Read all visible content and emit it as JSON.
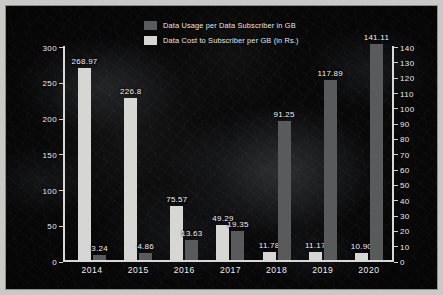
{
  "chart_data": {
    "type": "bar",
    "title": "",
    "xlabel": "",
    "categories": [
      "2014",
      "2015",
      "2016",
      "2017",
      "2018",
      "2019",
      "2020"
    ],
    "series": [
      {
        "name": "Data Cost to Subscriber per GB (in Rs.)",
        "axis": "left",
        "color": "#d6d6d4",
        "values": [
          268.97,
          226.8,
          75.57,
          49.29,
          11.78,
          11.17,
          10.9
        ],
        "labels": [
          "268.97",
          "226.8",
          "75.57",
          "49.29",
          "11.78",
          "11.17",
          "10.90"
        ]
      },
      {
        "name": "Data Usage per Data Subscriber in GB",
        "axis": "right",
        "color": "#585a5c",
        "values": [
          3.24,
          4.86,
          13.63,
          19.35,
          91.25,
          117.89,
          141.11
        ],
        "labels": [
          "3.24",
          "4.86",
          "13.63",
          "19.35",
          "91.25",
          "117.89",
          "141.11"
        ]
      }
    ],
    "left_axis": {
      "label": "",
      "ylim": [
        0,
        300
      ],
      "ticks": [
        "0",
        "50",
        "100",
        "150",
        "200",
        "250",
        "300"
      ],
      "tick_values": [
        0,
        50,
        100,
        150,
        200,
        250,
        300
      ]
    },
    "right_axis": {
      "label": "",
      "ylim": [
        0,
        140
      ],
      "ticks": [
        "0",
        "10",
        "20",
        "30",
        "40",
        "50",
        "60",
        "70",
        "80",
        "90",
        "100",
        "110",
        "120",
        "130",
        "140"
      ],
      "tick_values": [
        0,
        10,
        20,
        30,
        40,
        50,
        60,
        70,
        80,
        90,
        100,
        110,
        120,
        130,
        140
      ]
    },
    "legend": {
      "position": "top-center",
      "entries": [
        {
          "label": "Data Usage per Data Subscriber in GB",
          "color": "#585a5c"
        },
        {
          "label": "Data Cost to Subscriber per GB (in Rs.)",
          "color": "#d6d6d4"
        }
      ]
    },
    "grid": false,
    "background_color": "#080809",
    "frame_color": "#c9c9c7",
    "axis_color": "#d8d8d8",
    "text_color": "#eeeeee"
  }
}
